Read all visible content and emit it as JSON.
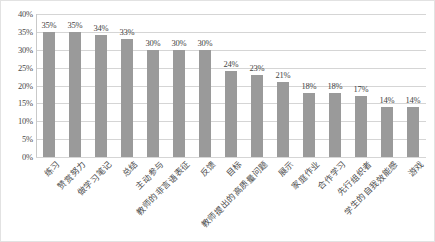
{
  "chart_data": {
    "type": "bar",
    "title": "",
    "subtitle": "",
    "xlabel": "",
    "ylabel": "",
    "ylim": [
      0,
      40
    ],
    "y_tick_step": 5,
    "grid": true,
    "legend": false,
    "value_suffix": "%",
    "categories": [
      "练习",
      "赞赏努力",
      "做学习笔记",
      "总结",
      "主动参与",
      "教师的非言语表征",
      "反馈",
      "目标",
      "教师提出的高质量问题",
      "展示",
      "家庭作业",
      "合作学习",
      "先行组织者",
      "学生的自我效能感",
      "游戏"
    ],
    "values": [
      35,
      35,
      34,
      33,
      30,
      30,
      30,
      24,
      23,
      21,
      18,
      18,
      17,
      14,
      14
    ],
    "value_labels": [
      "35%",
      "35%",
      "34%",
      "33%",
      "30%",
      "30%",
      "30%",
      "24%",
      "23%",
      "21%",
      "18%",
      "18%",
      "17%",
      "14%",
      "14%"
    ],
    "y_tick_labels": [
      "40%",
      "35%",
      "30%",
      "25%",
      "20%",
      "15%",
      "10%",
      "5%",
      "0%"
    ],
    "y_tick_values": [
      40,
      35,
      30,
      25,
      20,
      15,
      10,
      5,
      0
    ],
    "colors": {
      "bar": "#9a9a9a",
      "gridline": "#d5d5d5",
      "border": "#e2e2e2",
      "text": "#3f3f3f"
    }
  }
}
